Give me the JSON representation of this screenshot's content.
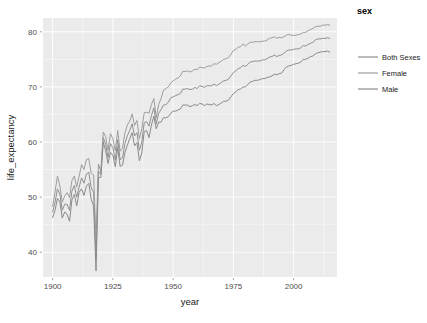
{
  "chart_data": {
    "type": "line",
    "title": "",
    "xlabel": "year",
    "ylabel": "life_expectancy",
    "xlim": [
      1896,
      2018
    ],
    "ylim": [
      35.5,
      82.5
    ],
    "xticks": [
      1900,
      1925,
      1950,
      1975,
      2000
    ],
    "xtick_labels": [
      "1900",
      "1925",
      "1950",
      "1975",
      "2000"
    ],
    "yticks": [
      40,
      50,
      60,
      70,
      80
    ],
    "ytick_labels": [
      "40",
      "50",
      "60",
      "70",
      "80"
    ],
    "grid": true,
    "grid_color": "#ffffff",
    "panel_color": "#ebebeb",
    "legend": {
      "title": "sex",
      "position": "right",
      "entries": [
        {
          "label": "Both Sexes",
          "color": "#8f8f8f"
        },
        {
          "label": "Female",
          "color": "#9d9d9d"
        },
        {
          "label": "Male",
          "color": "#8a8a8a"
        }
      ]
    },
    "x": [
      1900,
      1901,
      1902,
      1903,
      1904,
      1905,
      1906,
      1907,
      1908,
      1909,
      1910,
      1911,
      1912,
      1913,
      1914,
      1915,
      1916,
      1917,
      1918,
      1919,
      1920,
      1921,
      1922,
      1923,
      1924,
      1925,
      1926,
      1927,
      1928,
      1929,
      1930,
      1931,
      1932,
      1933,
      1934,
      1935,
      1936,
      1937,
      1938,
      1939,
      1940,
      1941,
      1942,
      1943,
      1944,
      1945,
      1946,
      1947,
      1948,
      1949,
      1950,
      1951,
      1952,
      1953,
      1954,
      1955,
      1956,
      1957,
      1958,
      1959,
      1960,
      1961,
      1962,
      1963,
      1964,
      1965,
      1966,
      1967,
      1968,
      1969,
      1970,
      1971,
      1972,
      1973,
      1974,
      1975,
      1976,
      1977,
      1978,
      1979,
      1980,
      1981,
      1982,
      1983,
      1984,
      1985,
      1986,
      1987,
      1988,
      1989,
      1990,
      1991,
      1992,
      1993,
      1994,
      1995,
      1996,
      1997,
      1998,
      1999,
      2000,
      2001,
      2002,
      2003,
      2004,
      2005,
      2006,
      2007,
      2008,
      2009,
      2010,
      2011,
      2012,
      2013,
      2014,
      2015
    ],
    "series": [
      {
        "name": "Both Sexes",
        "color": "#8f8f8f",
        "values": [
          47.3,
          49.1,
          51.5,
          50.5,
          47.6,
          48.7,
          48.7,
          47.6,
          51.1,
          52.1,
          50.0,
          51.8,
          53.5,
          52.5,
          54.2,
          54.5,
          51.7,
          50.9,
          39.1,
          54.7,
          54.1,
          60.8,
          59.6,
          57.2,
          59.7,
          59.0,
          56.7,
          60.4,
          56.8,
          57.1,
          59.7,
          61.1,
          62.1,
          63.3,
          61.1,
          61.7,
          58.5,
          60.0,
          63.5,
          63.7,
          62.9,
          64.8,
          66.2,
          63.3,
          65.2,
          65.9,
          66.7,
          66.8,
          67.2,
          68.0,
          68.2,
          68.4,
          68.6,
          68.8,
          69.6,
          69.6,
          69.7,
          69.5,
          69.6,
          69.9,
          69.7,
          70.2,
          70.1,
          69.9,
          70.2,
          70.2,
          70.2,
          70.5,
          70.2,
          70.5,
          70.8,
          71.1,
          71.2,
          71.4,
          72.0,
          72.6,
          72.9,
          73.3,
          73.5,
          73.9,
          73.7,
          74.1,
          74.5,
          74.6,
          74.7,
          74.7,
          74.7,
          74.9,
          74.9,
          75.1,
          75.4,
          75.5,
          75.8,
          75.5,
          75.7,
          75.8,
          76.1,
          76.5,
          76.7,
          76.7,
          76.8,
          76.9,
          76.9,
          77.1,
          77.5,
          77.4,
          77.7,
          77.9,
          78.1,
          78.5,
          78.7,
          78.7,
          78.8,
          78.8,
          78.9,
          78.8
        ]
      },
      {
        "name": "Female",
        "color": "#9d9d9d",
        "values": [
          48.3,
          51.0,
          53.8,
          52.0,
          49.1,
          50.2,
          50.8,
          49.9,
          53.0,
          53.8,
          51.8,
          53.8,
          55.9,
          55.0,
          56.8,
          57.0,
          54.3,
          54.0,
          42.2,
          56.0,
          54.6,
          61.8,
          61.0,
          58.5,
          61.5,
          60.6,
          58.4,
          62.1,
          58.3,
          58.9,
          61.6,
          63.1,
          63.8,
          65.1,
          63.0,
          63.9,
          60.6,
          62.4,
          65.3,
          65.4,
          65.2,
          66.8,
          67.9,
          64.4,
          66.8,
          67.9,
          69.4,
          69.7,
          70.0,
          70.7,
          71.1,
          71.4,
          71.6,
          72.0,
          72.8,
          72.8,
          72.9,
          72.7,
          72.9,
          73.2,
          73.1,
          73.6,
          73.5,
          73.4,
          73.7,
          73.8,
          73.8,
          74.2,
          74.1,
          74.4,
          74.7,
          75.0,
          75.1,
          75.3,
          75.9,
          76.6,
          76.8,
          77.2,
          77.3,
          77.8,
          77.4,
          77.8,
          78.1,
          78.1,
          78.2,
          78.2,
          78.2,
          78.3,
          78.3,
          78.5,
          78.8,
          78.9,
          79.1,
          78.8,
          79.0,
          78.9,
          79.1,
          79.4,
          79.5,
          79.4,
          79.3,
          79.4,
          79.5,
          79.6,
          79.9,
          79.9,
          80.2,
          80.4,
          80.6,
          80.9,
          81.0,
          81.0,
          81.2,
          81.2,
          81.3,
          81.2
        ]
      },
      {
        "name": "Male",
        "color": "#8a8a8a",
        "values": [
          46.3,
          47.6,
          49.8,
          49.1,
          46.2,
          47.3,
          46.9,
          45.6,
          49.5,
          50.5,
          48.4,
          50.9,
          51.5,
          50.3,
          52.0,
          52.5,
          49.6,
          48.4,
          36.6,
          53.5,
          53.6,
          60.0,
          58.4,
          56.1,
          58.1,
          57.6,
          55.5,
          59.0,
          55.6,
          55.8,
          58.1,
          59.4,
          60.6,
          61.7,
          59.3,
          59.9,
          56.6,
          58.0,
          61.9,
          62.1,
          60.8,
          63.1,
          64.7,
          62.4,
          63.6,
          63.6,
          64.4,
          64.4,
          64.6,
          65.2,
          65.6,
          65.6,
          65.8,
          66.0,
          66.7,
          66.7,
          66.7,
          66.4,
          66.6,
          66.8,
          66.6,
          67.0,
          66.9,
          66.6,
          66.9,
          66.8,
          66.7,
          67.0,
          66.6,
          66.8,
          67.1,
          67.4,
          67.4,
          67.6,
          68.2,
          68.8,
          69.1,
          69.5,
          69.6,
          70.0,
          70.0,
          70.4,
          70.9,
          71.0,
          71.2,
          71.2,
          71.3,
          71.5,
          71.5,
          71.7,
          71.8,
          72.0,
          72.3,
          72.2,
          72.4,
          72.5,
          73.1,
          73.6,
          73.8,
          73.9,
          74.1,
          74.2,
          74.3,
          74.5,
          75.0,
          75.0,
          75.2,
          75.5,
          75.6,
          76.0,
          76.2,
          76.3,
          76.4,
          76.4,
          76.5,
          76.3
        ]
      }
    ]
  }
}
